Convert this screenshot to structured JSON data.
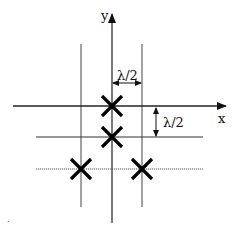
{
  "diagram": {
    "axes": {
      "x_label": "x",
      "y_label": "y"
    },
    "dimensions": {
      "horizontal_spacing_label": "λ/2",
      "vertical_spacing_label": "λ/2"
    },
    "elements": [
      {
        "id": "e1",
        "marker": "cross",
        "grid_col": 0,
        "grid_row": 0
      },
      {
        "id": "e2",
        "marker": "cross",
        "grid_col": 0,
        "grid_row": -1
      },
      {
        "id": "e3",
        "marker": "cross",
        "grid_col": -1,
        "grid_row": -2
      },
      {
        "id": "e4",
        "marker": "cross",
        "grid_col": 1,
        "grid_row": -2
      }
    ],
    "grid_lines": {
      "vertical": [
        "x = -λ/2",
        "x = 0 (y-axis)",
        "x = λ/2"
      ],
      "horizontal": [
        "y = 0 (x-axis)",
        "y = -λ/2",
        "y = -λ (dotted)"
      ]
    },
    "colors": {
      "line": "#333333",
      "marker": "#000000",
      "background": "#ffffff"
    },
    "footnote_mark": "·"
  }
}
